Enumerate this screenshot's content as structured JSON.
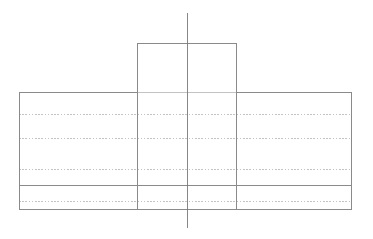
{
  "drawing": {
    "title": "T-Section Front View",
    "view_name": "front-view",
    "projection": "orthographic",
    "canvas": {
      "width": 373,
      "height": 239,
      "background": "#ffffff"
    },
    "colors": {
      "visible_edge": "#8a8a8a",
      "hidden_edge": "#bdbdbd",
      "center_line": "#7a7a7a",
      "background": "#ffffff"
    },
    "stroke_widths": {
      "visible_edge": 1.0,
      "hidden_edge": 0.9,
      "center_line": 0.9
    },
    "hidden_dash_pattern": "1.6 1.6",
    "geometry": {
      "stem_rect": {
        "name": "upper-flange-rectangle",
        "x1": 137,
        "y1": 43,
        "x2": 237,
        "y2": 92
      },
      "body_rect": {
        "name": "main-body-rectangle",
        "x1": 19,
        "y1": 92,
        "x2": 352,
        "y2": 209
      },
      "stem_side_lines": [
        {
          "name": "stem-left-edge-extended",
          "x": 137,
          "y1": 43,
          "y2": 209
        },
        {
          "name": "stem-right-edge-extended",
          "x": 237,
          "y1": 43,
          "y2": 209
        }
      ],
      "center_line": {
        "name": "vertical-center-line",
        "x": 187,
        "y1": 13,
        "y2": 228
      },
      "visible_horizontal_lines": [
        {
          "name": "visible-edge-line-1",
          "y": 185,
          "x1": 19,
          "x2": 352
        }
      ],
      "hidden_horizontal_lines": [
        {
          "name": "hidden-edge-line-1",
          "y": 114,
          "x1": 19,
          "x2": 352
        },
        {
          "name": "hidden-edge-line-2",
          "y": 138,
          "x1": 19,
          "x2": 352
        },
        {
          "name": "hidden-edge-line-3",
          "y": 169,
          "x1": 19,
          "x2": 352
        },
        {
          "name": "hidden-edge-line-4",
          "y": 201,
          "x1": 19,
          "x2": 352
        }
      ]
    },
    "labels": {
      "dimensions": [],
      "annotations": [],
      "notes": []
    }
  }
}
